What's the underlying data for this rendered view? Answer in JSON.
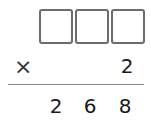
{
  "problem": {
    "type": "vertical-multiplication",
    "multiplicand_boxes": [
      "",
      "",
      ""
    ],
    "operator": "×",
    "multiplier": "2",
    "product_digits": [
      "2",
      "6",
      "8"
    ]
  }
}
